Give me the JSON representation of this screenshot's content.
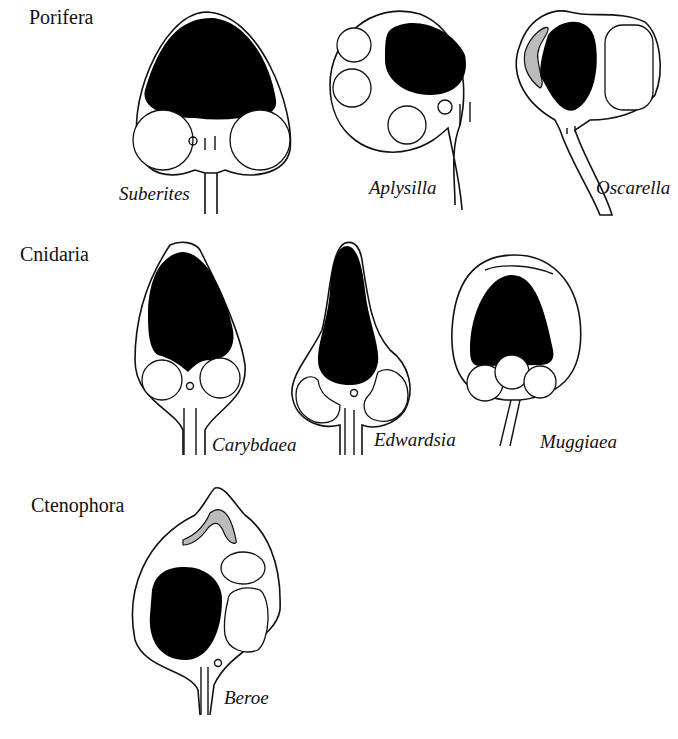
{
  "figure": {
    "groups": [
      {
        "label": "Porifera",
        "species": [
          "Suberites",
          "Aplysilla",
          "Oscarella"
        ]
      },
      {
        "label": "Cnidaria",
        "species": [
          "Carybdaea",
          "Edwardsia",
          "Muggiaea"
        ]
      },
      {
        "label": "Ctenophora",
        "species": [
          "Beroe"
        ]
      }
    ]
  }
}
